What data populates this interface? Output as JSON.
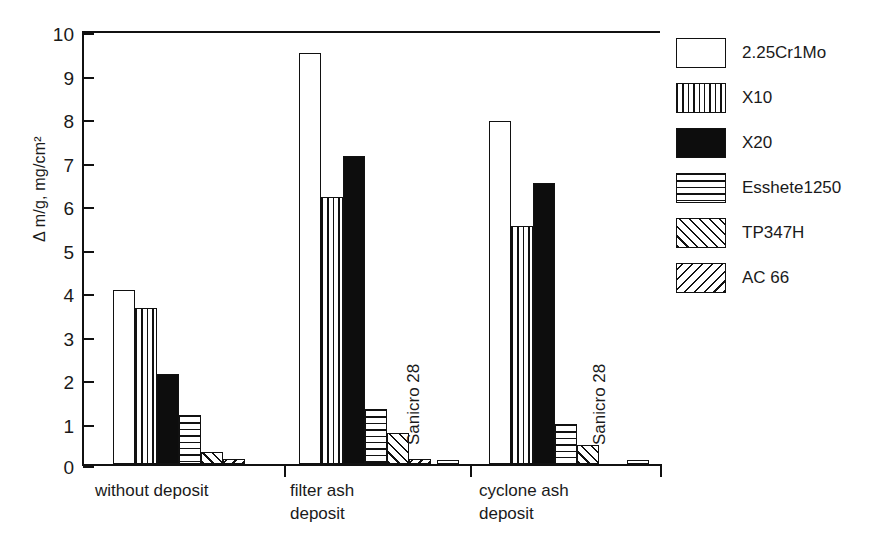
{
  "chart_data": {
    "type": "bar",
    "title": "",
    "subtitle": "",
    "xlabel": "",
    "ylabel": "Δ m/g, mg/cm²",
    "ylim": [
      0,
      10
    ],
    "ytick_labels": [
      "0",
      "1",
      "2",
      "3",
      "4",
      "5",
      "6",
      "7",
      "8",
      "9",
      "10"
    ],
    "ytick_values": [
      0,
      1,
      2,
      3,
      4,
      5,
      6,
      7,
      8,
      9,
      10
    ],
    "grid": false,
    "legend_position": "right",
    "categories": [
      "without deposit",
      "filter ash\ndeposit",
      "cyclone ash\ndeposit"
    ],
    "series": [
      {
        "name": "2.25Cr1Mo",
        "fill": "blank",
        "values": [
          4.0,
          9.45,
          7.88
        ]
      },
      {
        "name": "X10",
        "fill": "vert",
        "values": [
          3.59,
          6.13,
          5.47
        ]
      },
      {
        "name": "X20",
        "fill": "solid",
        "values": [
          2.07,
          7.08,
          6.47
        ]
      },
      {
        "name": "Esshete1250",
        "fill": "horiz",
        "values": [
          1.13,
          1.27,
          0.92
        ]
      },
      {
        "name": "TP347H",
        "fill": "diag-fwd",
        "values": [
          0.28,
          0.72,
          0.43
        ]
      },
      {
        "name": "AC 66",
        "fill": "diag-back",
        "values": [
          0.12,
          0.11,
          0.0
        ]
      }
    ],
    "annotations": [
      {
        "text": "Sanicro 28",
        "group": "filter ash deposit",
        "value": 0.1
      },
      {
        "text": "Sanicro 28",
        "group": "cyclone ash deposit",
        "value": 0.1
      }
    ]
  },
  "legend": {
    "items": [
      {
        "label": "2.25Cr1Mo",
        "fill": "blank"
      },
      {
        "label": "X10",
        "fill": "vert"
      },
      {
        "label": "X20",
        "fill": "solid"
      },
      {
        "label": "Esshete1250",
        "fill": "horiz"
      },
      {
        "label": "TP347H",
        "fill": "diag-fwd"
      },
      {
        "label": "AC 66",
        "fill": "diag-back"
      }
    ]
  },
  "axis": {
    "y_title": "Δ m/g, mg/cm²",
    "y_ticks": [
      "10",
      "9",
      "8",
      "7",
      "6",
      "5",
      "4",
      "3",
      "2",
      "1",
      "0"
    ]
  },
  "x_labels": {
    "g1": "without deposit",
    "g2": "filter ash\ndeposit",
    "g3": "cyclone ash\ndeposit"
  },
  "in_plot_labels": {
    "sanicro_g2": "Sanicro 28",
    "sanicro_g3": "Sanicro 28"
  },
  "colors": {
    "ink": "#111111",
    "paper": "#ffffff"
  }
}
